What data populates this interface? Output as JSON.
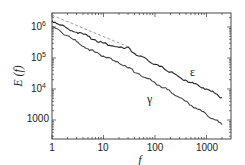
{
  "chart_data": {
    "type": "line",
    "title": "",
    "xlabel": "f",
    "ylabel": "E (f)",
    "xscale": "log",
    "yscale": "log",
    "xlim": [
      1,
      2950
    ],
    "ylim": [
      245,
      2800000
    ],
    "grid": false,
    "x_ticks": [
      1,
      10,
      100,
      1000
    ],
    "x_tick_labels": [
      "1",
      "10",
      "100",
      "1000"
    ],
    "y_ticks": [
      1000,
      10000,
      100000,
      1000000
    ],
    "y_tick_labels": [
      "1000",
      "10^4",
      "10^5",
      "10^6"
    ],
    "series": [
      {
        "name": "ε",
        "style": "solid",
        "color": "#222222",
        "x": [
          1,
          1.5,
          2,
          3,
          5,
          7,
          10,
          15,
          20,
          25,
          30,
          35,
          50,
          70,
          100,
          150,
          200,
          300,
          500,
          700,
          1000,
          1500,
          2000
        ],
        "values": [
          1600000,
          1150000,
          900000,
          680000,
          500000,
          380000,
          300000,
          250000,
          220000,
          200000,
          230000,
          160000,
          115000,
          90000,
          62000,
          45000,
          35000,
          24000,
          16000,
          13000,
          10000,
          7000,
          5200
        ]
      },
      {
        "name": "γ",
        "style": "solid",
        "color": "#444444",
        "x": [
          1,
          1.5,
          2,
          3,
          5,
          7,
          10,
          15,
          20,
          30,
          50,
          70,
          100,
          150,
          200,
          300,
          500,
          700,
          1000,
          1500,
          2000
        ],
        "values": [
          1000000,
          700000,
          520000,
          340000,
          200000,
          150000,
          115000,
          85000,
          68000,
          48000,
          30000,
          22000,
          16000,
          11000,
          8200,
          5300,
          3000,
          2200,
          1500,
          1000,
          700
        ]
      },
      {
        "name": "reference",
        "style": "dashed",
        "color": "#888888",
        "x": [
          1,
          30
        ],
        "values": [
          2400000,
          230000
        ]
      }
    ],
    "annotations": [
      {
        "text": "ε",
        "x": 600,
        "y": 20000
      },
      {
        "text": "γ",
        "x": 90,
        "y": 2500
      }
    ],
    "legend": "none (inline labels)"
  },
  "labels": {
    "xlabel": "f",
    "ylabel": "E (f)",
    "eps": "ε",
    "gamma": "γ",
    "x1": "1",
    "x10": "10",
    "x100": "100",
    "x1000": "1000",
    "y1000": "1000",
    "y4": "10",
    "y4exp": "4",
    "y5": "10",
    "y5exp": "5",
    "y6": "10",
    "y6exp": "6"
  }
}
